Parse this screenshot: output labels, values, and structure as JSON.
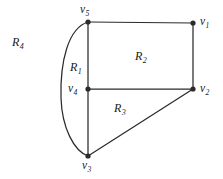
{
  "figure": {
    "type": "planar-graph-region-diagram",
    "width": 223,
    "height": 179,
    "background_color": "#ffffff",
    "stroke_color": "#2b2b2b",
    "text_color": "#1a1a1a"
  },
  "vertices": [
    {
      "id": "v1",
      "base": "v",
      "subscript": "1",
      "x": 193,
      "y": 23,
      "label_x": 200,
      "label_y": 16,
      "label_position": "right"
    },
    {
      "id": "v2",
      "base": "v",
      "subscript": "2",
      "x": 193,
      "y": 89,
      "label_x": 200,
      "label_y": 83,
      "label_position": "right"
    },
    {
      "id": "v3",
      "base": "v",
      "subscript": "3",
      "x": 88,
      "y": 156,
      "label_x": 82,
      "label_y": 160,
      "label_position": "below"
    },
    {
      "id": "v4",
      "base": "v",
      "subscript": "4",
      "x": 88,
      "y": 89,
      "label_x": 68,
      "label_y": 83,
      "label_position": "left"
    },
    {
      "id": "v5",
      "base": "v",
      "subscript": "5",
      "x": 88,
      "y": 22,
      "label_x": 80,
      "label_y": 4,
      "label_position": "above"
    }
  ],
  "edges": [
    {
      "id": "e-v5-v1",
      "from": "v5",
      "to": "v1",
      "shape": "straight"
    },
    {
      "id": "e-v1-v2",
      "from": "v1",
      "to": "v2",
      "shape": "straight"
    },
    {
      "id": "e-v4-v2",
      "from": "v4",
      "to": "v2",
      "shape": "straight"
    },
    {
      "id": "e-v5-v4",
      "from": "v5",
      "to": "v4",
      "shape": "straight"
    },
    {
      "id": "e-v4-v3",
      "from": "v4",
      "to": "v3",
      "shape": "straight"
    },
    {
      "id": "e-v3-v2",
      "from": "v3",
      "to": "v2",
      "shape": "straight"
    },
    {
      "id": "e-v5-v3-arc",
      "from": "v5",
      "to": "v3",
      "shape": "curved-left-arc"
    }
  ],
  "regions": [
    {
      "id": "R1",
      "base": "R",
      "subscript": "1",
      "label_x": 70,
      "label_y": 61,
      "description": "region between arc and left vertical edge"
    },
    {
      "id": "R2",
      "base": "R",
      "subscript": "2",
      "label_x": 135,
      "label_y": 50,
      "description": "upper rectangle region"
    },
    {
      "id": "R3",
      "base": "R",
      "subscript": "3",
      "label_x": 114,
      "label_y": 102,
      "description": "lower triangular region"
    },
    {
      "id": "R4",
      "base": "R",
      "subscript": "4",
      "label_x": 12,
      "label_y": 36,
      "description": "unbounded outer region"
    }
  ]
}
